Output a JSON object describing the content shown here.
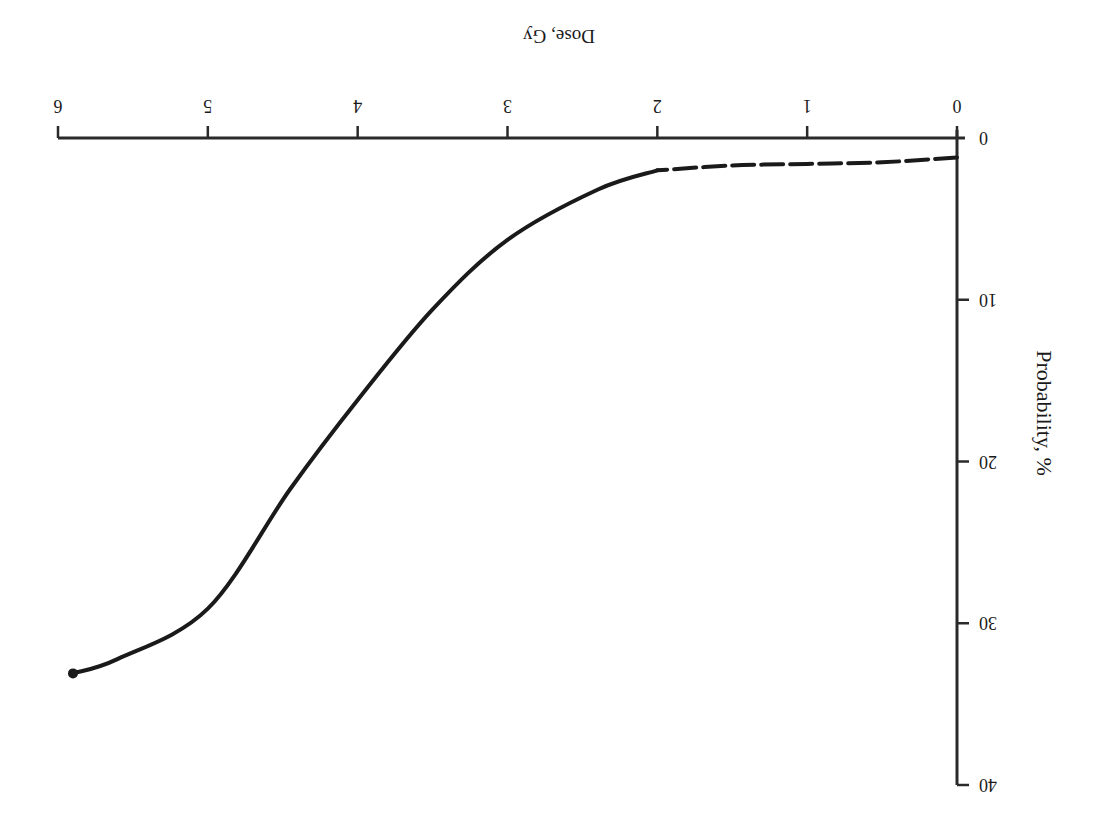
{
  "chart_data": {
    "type": "line",
    "title": "",
    "orientation_note": "figure rendered rotated 180 degrees",
    "xlabel": "Dose, Gy",
    "ylabel": "Probability, %",
    "xlim": [
      0,
      6
    ],
    "ylim": [
      0,
      40
    ],
    "x_ticks": [
      "0",
      "1",
      "2",
      "3",
      "4",
      "5",
      "6"
    ],
    "y_ticks": [
      "0",
      "10",
      "20",
      "30",
      "40"
    ],
    "grid": false,
    "legend": null,
    "series": [
      {
        "name": "threshold-region (dashed)",
        "style": "dashed",
        "x": [
          0.0,
          0.5,
          1.0,
          1.5,
          2.0
        ],
        "y": [
          1.2,
          1.5,
          1.6,
          1.7,
          2.0
        ]
      },
      {
        "name": "dose-response (solid)",
        "style": "solid",
        "x": [
          2.0,
          2.4,
          3.0,
          3.5,
          4.0,
          4.45,
          5.0,
          5.6,
          5.9
        ],
        "y": [
          2.0,
          3.2,
          6.3,
          10.6,
          16.2,
          21.7,
          29.1,
          32.2,
          33.1
        ]
      }
    ],
    "colors": {
      "axis": "#2a2a2a",
      "curve": "#1a1a1a",
      "background": "#ffffff"
    }
  }
}
